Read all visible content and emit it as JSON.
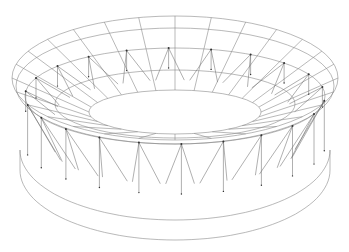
{
  "diagram": {
    "title": "",
    "colors": {
      "background": "#ffffff",
      "line": "#8a8a8a",
      "node": "#333333"
    },
    "geometry": {
      "center_x": 175,
      "roof_outer": {
        "cy": 78,
        "rx": 163,
        "ry": 62
      },
      "roof_inner_lip": {
        "cy": 96,
        "rx": 150,
        "ry": 48
      },
      "opening": {
        "cy": 112,
        "rx": 86,
        "ry": 22
      },
      "base_top": {
        "cy": 150,
        "rx": 155,
        "ry": 70
      },
      "base_bottom": {
        "cy": 170,
        "rx": 155,
        "ry": 70
      },
      "radial_ribs": 28,
      "support_struts": 22
    }
  }
}
